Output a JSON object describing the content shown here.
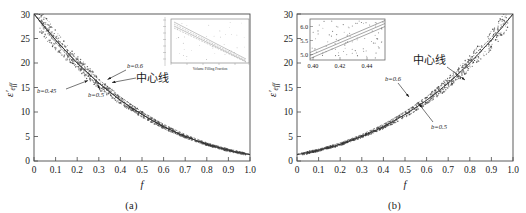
{
  "figure": {
    "title": "",
    "panels": [
      {
        "id": "a",
        "caption": "(a)",
        "xlabel": "f",
        "ylabel": "ε'eff",
        "xticks": [
          "0",
          "0.1",
          "0.2",
          "0.3",
          "0.4",
          "0.5",
          "0.6",
          "0.7",
          "0.8",
          "0.9",
          "1.0"
        ],
        "yticks": [
          "0",
          "5",
          "10",
          "15",
          "20",
          "25",
          "30"
        ],
        "annotations": [
          {
            "name": "b-0.6",
            "text": "b=0.6"
          },
          {
            "name": "b-0.45",
            "text": "b=0.45"
          },
          {
            "name": "b-0.5",
            "text": "b=0.5"
          },
          {
            "name": "center-line",
            "text": "中心线"
          }
        ],
        "inset": {
          "xlabel": "Volume Filling Fraction",
          "xticks": [
            "0.0",
            "0.2",
            "0.4",
            "0.6",
            "0.8",
            "1.0"
          ],
          "yticks": [
            "30",
            "25",
            "20",
            "15",
            "10",
            "5",
            "0"
          ]
        }
      },
      {
        "id": "b",
        "caption": "(b)",
        "xlabel": "f",
        "ylabel": "ε'eff",
        "xticks": [
          "0",
          "0.1",
          "0.2",
          "0.3",
          "0.4",
          "0.5",
          "0.6",
          "0.7",
          "0.8",
          "0.9",
          "1.0"
        ],
        "yticks": [
          "0",
          "5",
          "10",
          "15",
          "20",
          "25",
          "30"
        ],
        "annotations": [
          {
            "name": "center-line",
            "text": "中心线"
          },
          {
            "name": "b-0.6",
            "text": "b=0.6"
          },
          {
            "name": "b-0.5",
            "text": "b=0.5"
          }
        ],
        "inset": {
          "xticks": [
            "0.40",
            "0.42",
            "0.44"
          ],
          "yticks": [
            "5.0",
            "5.5",
            "6.0"
          ]
        }
      }
    ]
  },
  "colors": {
    "axis": "#4a4a4a",
    "scatter": "#3a3a3a",
    "curve": "#555555",
    "inset_frame": "#6a6a6a",
    "text": "#1a1a1a"
  },
  "chart_data": [
    {
      "type": "scatter",
      "panel": "a",
      "title": "",
      "xlabel": "f",
      "ylabel": "ε'eff",
      "xlim": [
        0,
        1.0
      ],
      "ylim": [
        0,
        30
      ],
      "grid": false,
      "legend": null,
      "description": "Effective permittivity decreasing monotonically from ~29.5 at f=0.02 to ~1.3 at f=1.0; dense scatter band of simulated points straddles three fitted curves for b=0.45, b=0.5, b=0.6 plus a center line.",
      "series": [
        {
          "name": "center-line",
          "x": [
            0.0,
            0.05,
            0.1,
            0.15,
            0.2,
            0.25,
            0.3,
            0.35,
            0.4,
            0.45,
            0.5,
            0.55,
            0.6,
            0.65,
            0.7,
            0.75,
            0.8,
            0.85,
            0.9,
            0.95,
            1.0
          ],
          "y": [
            30.0,
            27.3,
            24.7,
            22.3,
            20.0,
            17.9,
            15.9,
            14.1,
            12.4,
            10.9,
            9.5,
            8.2,
            7.0,
            6.0,
            5.0,
            4.2,
            3.4,
            2.8,
            2.2,
            1.7,
            1.3
          ]
        },
        {
          "name": "b=0.45",
          "x": [
            0.0,
            0.1,
            0.2,
            0.3,
            0.4,
            0.5,
            0.6,
            0.7,
            0.8,
            0.9,
            1.0
          ],
          "y": [
            30.0,
            24.2,
            19.3,
            15.2,
            11.8,
            9.0,
            6.6,
            4.7,
            3.2,
            2.0,
            1.3
          ]
        },
        {
          "name": "b=0.5",
          "x": [
            0.0,
            0.1,
            0.2,
            0.3,
            0.4,
            0.5,
            0.6,
            0.7,
            0.8,
            0.9,
            1.0
          ],
          "y": [
            30.0,
            24.7,
            20.0,
            15.9,
            12.4,
            9.5,
            7.0,
            5.0,
            3.4,
            2.2,
            1.3
          ]
        },
        {
          "name": "b=0.6",
          "x": [
            0.0,
            0.1,
            0.2,
            0.3,
            0.4,
            0.5,
            0.6,
            0.7,
            0.8,
            0.9,
            1.0
          ],
          "y": [
            30.0,
            25.2,
            20.7,
            16.6,
            13.1,
            10.0,
            7.5,
            5.4,
            3.7,
            2.4,
            1.4
          ]
        }
      ],
      "inset": {
        "type": "line",
        "xlabel": "Volume Filling Fraction",
        "xlim": [
          0.0,
          1.0
        ],
        "ylim": [
          0,
          30
        ],
        "series_count": 4
      }
    },
    {
      "type": "scatter",
      "panel": "b",
      "title": "",
      "xlabel": "f",
      "ylabel": "ε'eff",
      "xlim": [
        0,
        1.0
      ],
      "ylim": [
        0,
        30
      ],
      "grid": false,
      "legend": null,
      "description": "Effective permittivity increasing monotonically from ~1.3 at f=0.02 to ~29.5 at f=1.0; dense scatter band straddles fitted curves for b=0.5 and b=0.6 plus the center line. Inset magnifies f=0.40-0.45 range where eps' runs 4.9-6.2.",
      "series": [
        {
          "name": "center-line",
          "x": [
            0.0,
            0.05,
            0.1,
            0.15,
            0.2,
            0.25,
            0.3,
            0.35,
            0.4,
            0.45,
            0.5,
            0.55,
            0.6,
            0.65,
            0.7,
            0.75,
            0.8,
            0.85,
            0.9,
            0.95,
            1.0
          ],
          "y": [
            1.3,
            1.7,
            2.2,
            2.8,
            3.4,
            4.2,
            5.0,
            6.0,
            7.0,
            8.2,
            9.5,
            10.9,
            12.4,
            14.1,
            15.9,
            17.9,
            20.0,
            22.3,
            24.7,
            27.3,
            30.0
          ]
        },
        {
          "name": "b=0.6",
          "x": [
            0.0,
            0.1,
            0.2,
            0.3,
            0.4,
            0.5,
            0.6,
            0.7,
            0.8,
            0.9,
            1.0
          ],
          "y": [
            1.4,
            2.4,
            3.7,
            5.4,
            7.5,
            10.0,
            13.1,
            16.6,
            20.7,
            25.2,
            30.0
          ]
        },
        {
          "name": "b=0.5",
          "x": [
            0.0,
            0.1,
            0.2,
            0.3,
            0.4,
            0.5,
            0.6,
            0.7,
            0.8,
            0.9,
            1.0
          ],
          "y": [
            1.3,
            2.2,
            3.4,
            5.0,
            7.0,
            9.5,
            12.4,
            15.9,
            20.0,
            24.7,
            30.0
          ]
        }
      ],
      "inset": {
        "type": "scatter",
        "xlim": [
          0.395,
          0.452
        ],
        "ylim": [
          4.75,
          6.25
        ],
        "xticks": [
          0.4,
          0.42,
          0.44
        ],
        "yticks": [
          5.0,
          5.5,
          6.0
        ]
      }
    }
  ]
}
